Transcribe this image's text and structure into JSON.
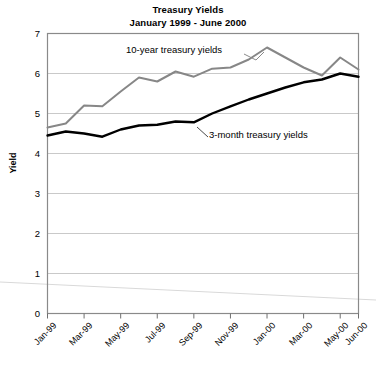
{
  "chart_data": {
    "type": "line",
    "title": "Treasury Yields",
    "subtitle": "January 1999 - June 2000",
    "xlabel": "",
    "ylabel": "Yield",
    "ylim": [
      0,
      7
    ],
    "ytick_step": 1,
    "grid": true,
    "legend_position": "inline-annotation",
    "x": [
      "Jan-99",
      "Feb-99",
      "Mar-99",
      "Apr-99",
      "May-99",
      "Jun-99",
      "Jul-99",
      "Aug-99",
      "Sep-99",
      "Oct-99",
      "Nov-99",
      "Dec-99",
      "Jan-00",
      "Feb-00",
      "Mar-00",
      "Apr-00",
      "May-00",
      "Jun-00"
    ],
    "xtick_labels": [
      "Jan-99",
      "Mar-99",
      "May-99",
      "Jul-99",
      "Sep-99",
      "Nov-99",
      "Jan-00",
      "Mar-00",
      "May-00",
      "Jun-00"
    ],
    "yticks": [
      "0",
      "1",
      "2",
      "3",
      "4",
      "5",
      "6",
      "7"
    ],
    "series": [
      {
        "name": "10-year treasury yields",
        "color": "#878787",
        "values": [
          4.65,
          4.75,
          5.2,
          5.18,
          5.55,
          5.9,
          5.8,
          6.05,
          5.92,
          6.12,
          6.15,
          6.35,
          6.65,
          6.4,
          6.15,
          5.95,
          6.4,
          6.1
        ]
      },
      {
        "name": "3-month treasury yields",
        "color": "#000000",
        "values": [
          4.45,
          4.55,
          4.5,
          4.42,
          4.6,
          4.7,
          4.72,
          4.8,
          4.78,
          5.0,
          5.18,
          5.35,
          5.5,
          5.65,
          5.78,
          5.85,
          6.0,
          5.92
        ]
      }
    ],
    "annotations": [
      {
        "text": "10-year treasury yields",
        "series": "10-year treasury yields"
      },
      {
        "text": "3-month treasury yields",
        "series": "3-month treasury yields"
      }
    ]
  }
}
